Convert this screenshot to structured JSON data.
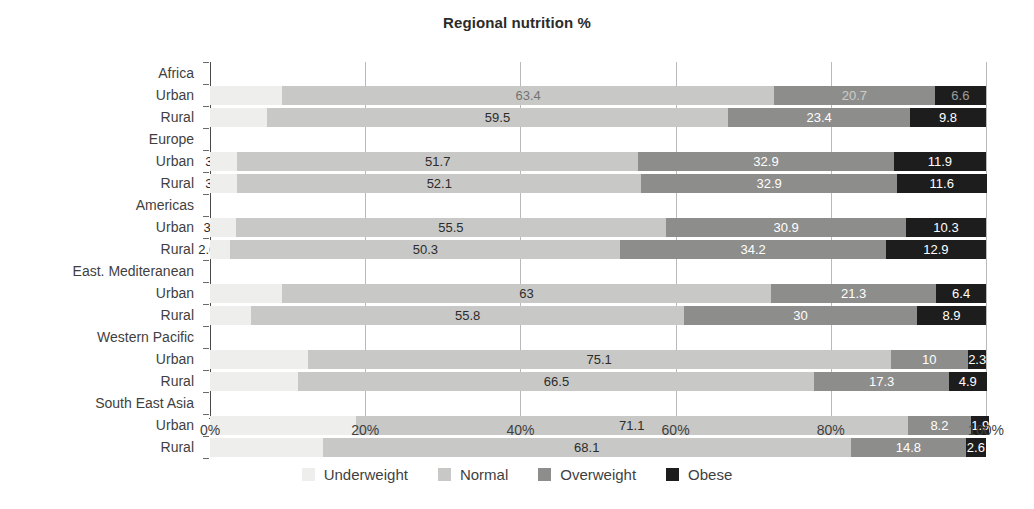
{
  "chart_data": {
    "type": "bar",
    "subtype": "horizontal-stacked-100",
    "title": "Regional nutrition %",
    "xlabel": "",
    "ylabel": "",
    "xlim": [
      0,
      100
    ],
    "xticks": [
      "0%",
      "20%",
      "40%",
      "60%",
      "80%",
      "100%"
    ],
    "xtick_values": [
      0,
      20,
      40,
      60,
      80,
      100
    ],
    "grid": true,
    "grid_axis": "x",
    "legend_position": "bottom",
    "series": [
      {
        "name": "Underweight",
        "color": "#eeeeec",
        "values": [
          9.3,
          7.3,
          3.5,
          3.5,
          3.3,
          2.6,
          9.3,
          5.3,
          12.6,
          11.4,
          18.8,
          14.5
        ]
      },
      {
        "name": "Normal",
        "color": "#c8c8c6",
        "values": [
          63.4,
          59.5,
          51.7,
          52.1,
          55.5,
          50.3,
          63,
          55.8,
          75.1,
          66.5,
          71.1,
          68.1
        ]
      },
      {
        "name": "Overweight",
        "color": "#8d8d8b",
        "values": [
          20.7,
          23.4,
          32.9,
          32.9,
          30.9,
          34.2,
          21.3,
          30,
          10,
          17.3,
          8.2,
          14.8
        ]
      },
      {
        "name": "Obese",
        "color": "#1d1d1d",
        "values": [
          6.6,
          9.8,
          11.9,
          11.6,
          10.3,
          12.9,
          6.4,
          8.9,
          2.3,
          4.9,
          1.9,
          2.6
        ]
      }
    ],
    "categories": [
      "Africa Urban",
      "Africa Rural",
      "Europe Urban",
      "Europe Rural",
      "Americas Urban",
      "Americas Rural",
      "East. Mediteranean Urban",
      "East. Mediteranean Rural",
      "Western Pacific Urban",
      "Western Pacific Rural",
      "South East Asia Urban",
      "South East Asia Rural"
    ],
    "groups": [
      {
        "region": "Africa",
        "rows": [
          "Urban",
          "Rural"
        ]
      },
      {
        "region": "Europe",
        "rows": [
          "Urban",
          "Rural"
        ]
      },
      {
        "region": "Americas",
        "rows": [
          "Urban",
          "Rural"
        ]
      },
      {
        "region": "East. Mediteranean",
        "rows": [
          "Urban",
          "Rural"
        ]
      },
      {
        "region": "Western Pacific",
        "rows": [
          "Urban",
          "Rural"
        ]
      },
      {
        "region": "South East Asia",
        "rows": [
          "Urban",
          "Rural"
        ]
      }
    ],
    "rows": [
      {
        "region": "Africa",
        "label": "Urban",
        "faded": true,
        "values": [
          9.3,
          63.4,
          20.7,
          6.6
        ],
        "labels": [
          "9.3",
          "63.4",
          "20.7",
          "6.6"
        ]
      },
      {
        "region": "Africa",
        "label": "Rural",
        "faded": false,
        "values": [
          7.3,
          59.5,
          23.4,
          9.8
        ],
        "labels": [
          "7.3",
          "59.5",
          "23.4",
          "9.8"
        ]
      },
      {
        "region": "Europe",
        "label": "Urban",
        "faded": false,
        "values": [
          3.5,
          51.7,
          32.9,
          11.9
        ],
        "labels": [
          "3.5",
          "51.7",
          "32.9",
          "11.9"
        ]
      },
      {
        "region": "Europe",
        "label": "Rural",
        "faded": false,
        "values": [
          3.5,
          52.1,
          32.9,
          11.6
        ],
        "labels": [
          "3.5",
          "52.1",
          "32.9",
          "11.6"
        ]
      },
      {
        "region": "Americas",
        "label": "Urban",
        "faded": false,
        "values": [
          3.3,
          55.5,
          30.9,
          10.3
        ],
        "labels": [
          "3.3",
          "55.5",
          "30.9",
          "10.3"
        ]
      },
      {
        "region": "Americas",
        "label": "Rural",
        "faded": false,
        "values": [
          2.6,
          50.3,
          34.2,
          12.9
        ],
        "labels": [
          "2.6",
          "50.3",
          "34.2",
          "12.9"
        ]
      },
      {
        "region": "East. Mediteranean",
        "label": "Urban",
        "faded": false,
        "values": [
          9.3,
          63,
          21.3,
          6.4
        ],
        "labels": [
          "9.3",
          "63",
          "21.3",
          "6.4"
        ]
      },
      {
        "region": "East. Mediteranean",
        "label": "Rural",
        "faded": false,
        "values": [
          5.3,
          55.8,
          30,
          8.9
        ],
        "labels": [
          "5.3",
          "55.8",
          "30",
          "8.9"
        ]
      },
      {
        "region": "Western Pacific",
        "label": "Urban",
        "faded": false,
        "values": [
          12.6,
          75.1,
          10,
          2.3
        ],
        "labels": [
          "12.6",
          "75.1",
          "10",
          "2.3"
        ]
      },
      {
        "region": "Western Pacific",
        "label": "Rural",
        "faded": false,
        "values": [
          11.4,
          66.5,
          17.3,
          4.9
        ],
        "labels": [
          "11.4",
          "66.5",
          "17.3",
          "4.9"
        ]
      },
      {
        "region": "South East Asia",
        "label": "Urban",
        "faded": false,
        "values": [
          18.8,
          71.1,
          8.2,
          1.9
        ],
        "labels": [
          "18.8",
          "71.1",
          "8.2",
          "1.9"
        ]
      },
      {
        "region": "South East Asia",
        "label": "Rural",
        "faded": false,
        "values": [
          14.5,
          68.1,
          14.8,
          2.6
        ],
        "labels": [
          "14.5",
          "68.1",
          "14.8",
          "2.6"
        ]
      }
    ]
  },
  "legend": {
    "items": [
      {
        "label": "Underweight",
        "color": "#eeeeec"
      },
      {
        "label": "Normal",
        "color": "#c8c8c6"
      },
      {
        "label": "Overweight",
        "color": "#8d8d8b"
      },
      {
        "label": "Obese",
        "color": "#1d1d1d"
      }
    ]
  }
}
